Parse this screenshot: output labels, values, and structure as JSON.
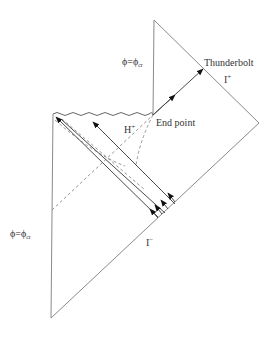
{
  "diagram": {
    "labels": {
      "phi_top": "ϕ=ϕ",
      "phi_top_sub": "cr",
      "phi_left": "ϕ=ϕ",
      "phi_left_sub": "cr",
      "thunderbolt": "Thunderbolt",
      "scri_plus": "I",
      "scri_plus_sup": "+",
      "end_point": "End point",
      "horizon": "H",
      "horizon_sup": "+",
      "scri_minus": "I",
      "scri_minus_sup": "−"
    },
    "colors": {
      "boundary": "#8a8a8a",
      "rays": "#4a4a4a",
      "arrowheads": "#111111",
      "text": "#333333"
    }
  }
}
